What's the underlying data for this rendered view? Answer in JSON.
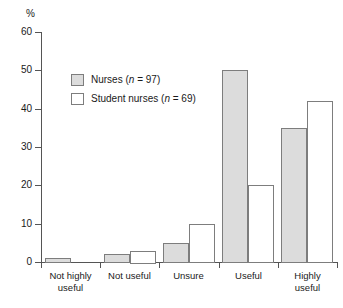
{
  "chart_data": {
    "type": "bar",
    "title": "",
    "xlabel": "",
    "ylabel": "%",
    "ylim": [
      0,
      60
    ],
    "yticks": [
      0,
      10,
      20,
      30,
      40,
      50,
      60
    ],
    "grid": false,
    "legend_position": "inside-upper-left",
    "categories": [
      "Not highly useful",
      "Not useful",
      "Unsure",
      "Useful",
      "Highly useful"
    ],
    "category_lines": [
      [
        "Not highly",
        "useful"
      ],
      [
        "Not useful",
        ""
      ],
      [
        "Unsure",
        ""
      ],
      [
        "Useful",
        ""
      ],
      [
        "Highly",
        "useful"
      ]
    ],
    "series": [
      {
        "name": "Nurses",
        "n": 97,
        "legend_label": "Nurses (n = 97)",
        "color": "#dcdcdc",
        "border_color": "#7d7d7d",
        "values": [
          1,
          2,
          5,
          50,
          35
        ]
      },
      {
        "name": "Student nurses",
        "n": 69,
        "legend_label": "Student nurses (n = 69)",
        "color": "#ffffff",
        "border_color": "#7d7d7d",
        "values": [
          0,
          3,
          10,
          20,
          42
        ]
      }
    ]
  },
  "axis": {
    "y_unit_label": "%",
    "axis_color": "#555555"
  },
  "legend": {
    "entries": [
      {
        "label_prefix": "Nurses (",
        "n_symbol": "n",
        "label_suffix": " = 97)"
      },
      {
        "label_prefix": "Student nurses (",
        "n_symbol": "n",
        "label_suffix": " = 69)"
      }
    ]
  }
}
